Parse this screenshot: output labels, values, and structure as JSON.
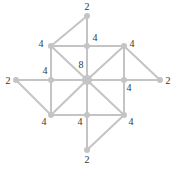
{
  "diagram": {
    "type": "graph",
    "colors": {
      "edge": "#c4c4c4",
      "node": "#c4c4c4",
      "label": "#333333"
    },
    "nodes": [
      {
        "id": "top",
        "x": 87,
        "y": 16,
        "r": 3,
        "label": "2",
        "lx": 87,
        "ly": 10
      },
      {
        "id": "tl",
        "x": 51,
        "y": 46,
        "r": 3,
        "label": "4",
        "lx": 41,
        "ly": 47
      },
      {
        "id": "tm",
        "x": 87,
        "y": 46,
        "r": 3,
        "label": "4",
        "lx": 95,
        "ly": 41
      },
      {
        "id": "tr",
        "x": 124,
        "y": 46,
        "r": 3,
        "label": "4",
        "lx": 132,
        "ly": 47
      },
      {
        "id": "left",
        "x": 16,
        "y": 80,
        "r": 3,
        "label": "2",
        "lx": 8,
        "ly": 84
      },
      {
        "id": "lm",
        "x": 51,
        "y": 80,
        "r": 3,
        "label": "4",
        "lx": 45,
        "ly": 74
      },
      {
        "id": "center",
        "x": 87,
        "y": 80,
        "r": 5,
        "label": "8",
        "lx": 81,
        "ly": 68
      },
      {
        "id": "rm",
        "x": 124,
        "y": 80,
        "r": 3,
        "label": "4",
        "lx": 129,
        "ly": 91
      },
      {
        "id": "right",
        "x": 160,
        "y": 80,
        "r": 3,
        "label": "2",
        "lx": 168,
        "ly": 84
      },
      {
        "id": "bl",
        "x": 51,
        "y": 115,
        "r": 3,
        "label": "4",
        "lx": 44,
        "ly": 125
      },
      {
        "id": "bm",
        "x": 87,
        "y": 115,
        "r": 3,
        "label": "4",
        "lx": 80,
        "ly": 125
      },
      {
        "id": "br",
        "x": 124,
        "y": 115,
        "r": 3,
        "label": "4",
        "lx": 131,
        "ly": 125
      },
      {
        "id": "bottom",
        "x": 87,
        "y": 150,
        "r": 3,
        "label": "2",
        "lx": 87,
        "ly": 163
      }
    ],
    "edges": [
      [
        "top",
        "tl"
      ],
      [
        "top",
        "tm"
      ],
      [
        "tl",
        "tm"
      ],
      [
        "tm",
        "tr"
      ],
      [
        "tl",
        "lm"
      ],
      [
        "tm",
        "center"
      ],
      [
        "tr",
        "rm"
      ],
      [
        "lm",
        "center"
      ],
      [
        "center",
        "rm"
      ],
      [
        "lm",
        "bl"
      ],
      [
        "center",
        "bm"
      ],
      [
        "rm",
        "br"
      ],
      [
        "bl",
        "bm"
      ],
      [
        "bm",
        "br"
      ],
      [
        "tl",
        "center"
      ],
      [
        "tr",
        "center"
      ],
      [
        "bl",
        "center"
      ],
      [
        "br",
        "center"
      ],
      [
        "tr",
        "right"
      ],
      [
        "rm",
        "right"
      ],
      [
        "left",
        "lm"
      ],
      [
        "left",
        "bl"
      ],
      [
        "br",
        "bottom"
      ],
      [
        "bm",
        "bottom"
      ]
    ]
  }
}
